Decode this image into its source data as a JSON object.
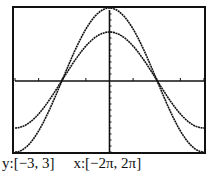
{
  "chart_data": {
    "type": "line",
    "title": "",
    "xlabel": "",
    "ylabel": "",
    "xlim": [
      -6.2832,
      6.2832
    ],
    "ylim": [
      -3,
      3
    ],
    "grid": false,
    "series": [
      {
        "name": "y = 3cos(x/2)",
        "amplitude": 3,
        "expr": "3*cos(x/2)"
      },
      {
        "name": "y = 2cos(x/2)",
        "amplitude": 2,
        "expr": "2*cos(x/2)"
      }
    ],
    "window_label_y": "y:[−3, 3]",
    "window_label_x": "x:[−2π, 2π]"
  },
  "caption": {
    "y_range": "y:[−3, 3]",
    "x_range": "x:[−2π, 2π]"
  },
  "colors": {
    "line": "#111111",
    "frame": "#111111",
    "background": "#ffffff"
  }
}
